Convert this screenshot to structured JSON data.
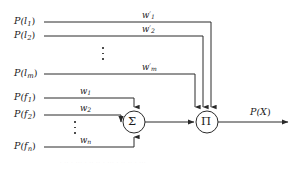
{
  "figure": {
    "type": "neural-node-diagram"
  },
  "inputs_top": [
    {
      "id": "in-l1",
      "base": "P(l",
      "sub": "1",
      "close": ")",
      "text": "P(l1)"
    },
    {
      "id": "in-l2",
      "base": "P(l",
      "sub": "2",
      "close": ")",
      "text": "P(l2)"
    },
    {
      "id": "in-lm",
      "base": "P(l",
      "sub": "m",
      "close": ")",
      "text": "P(lm)"
    }
  ],
  "inputs_bottom": [
    {
      "id": "in-f1",
      "base": "P(f",
      "sub": "1",
      "close": ")",
      "text": "P(f1)"
    },
    {
      "id": "in-f2",
      "base": "P(f",
      "sub": "2",
      "close": ")",
      "text": "P(f2)"
    },
    {
      "id": "in-fn",
      "base": "P(f",
      "sub": "n",
      "close": ")",
      "text": "P(fn)"
    }
  ],
  "weights_top": [
    {
      "id": "w-prime-1",
      "base": "w",
      "prime": "′",
      "sub": "1",
      "text": "w′1"
    },
    {
      "id": "w-prime-2",
      "base": "w",
      "prime": "′",
      "sub": "2",
      "text": "w′2"
    },
    {
      "id": "w-prime-m",
      "base": "w",
      "prime": "′",
      "sub": "m",
      "text": "w′m"
    }
  ],
  "weights_bottom": [
    {
      "id": "w-1",
      "base": "w",
      "prime": "",
      "sub": "1",
      "text": "w1"
    },
    {
      "id": "w-2",
      "base": "w",
      "prime": "",
      "sub": "2",
      "text": "w2"
    },
    {
      "id": "w-n",
      "base": "w",
      "prime": "",
      "sub": "n",
      "text": "wn"
    }
  ],
  "nodes": {
    "sum": {
      "glyph": "Σ",
      "name": "summation-node"
    },
    "product": {
      "glyph": "Π",
      "name": "product-node"
    }
  },
  "output": {
    "base": "P(X",
    "close": ")",
    "text": "P(X)"
  },
  "ellipsis": {
    "glyph": "⋮",
    "dot_count": 3
  },
  "colors": {
    "stroke": "#2a2a2a",
    "text": "#1a1a1a",
    "background": "#ffffff"
  },
  "geometry": {
    "sum_center": [
      134,
      122
    ],
    "product_center": [
      207,
      122
    ],
    "node_radius": 11
  },
  "scan_artifact": {
    "text": "· ·· · ··· · ·· ·· · ··· · ·· ·· · ···"
  }
}
